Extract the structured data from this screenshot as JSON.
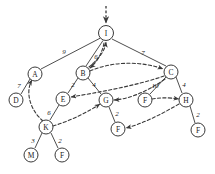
{
  "diagram": {
    "type": "directed-graph-with-back-edges",
    "title": "",
    "nodes": [
      {
        "id": "I",
        "label": "I",
        "x": 106,
        "y": 33,
        "r": 7.5
      },
      {
        "id": "A",
        "label": "A",
        "x": 35,
        "y": 74,
        "r": 7.0
      },
      {
        "id": "B",
        "label": "B",
        "x": 83,
        "y": 73,
        "r": 7.0
      },
      {
        "id": "C",
        "label": "C",
        "x": 171,
        "y": 72,
        "r": 7.0
      },
      {
        "id": "D",
        "label": "D",
        "x": 16,
        "y": 100,
        "r": 7.0
      },
      {
        "id": "E",
        "label": "E",
        "x": 63,
        "y": 99,
        "r": 7.0
      },
      {
        "id": "G",
        "label": "G",
        "x": 106,
        "y": 100,
        "r": 7.0
      },
      {
        "id": "F1",
        "label": "F",
        "x": 145,
        "y": 100,
        "r": 7.0
      },
      {
        "id": "H",
        "label": "H",
        "x": 186,
        "y": 100,
        "r": 7.0
      },
      {
        "id": "K",
        "label": "K",
        "x": 46,
        "y": 127,
        "r": 7.0
      },
      {
        "id": "F2",
        "label": "F",
        "x": 118,
        "y": 129,
        "r": 7.0
      },
      {
        "id": "F3",
        "label": "F",
        "x": 198,
        "y": 130,
        "r": 7.0
      },
      {
        "id": "M",
        "label": "M",
        "x": 31,
        "y": 155,
        "r": 7.0
      },
      {
        "id": "F4",
        "label": "F",
        "x": 62,
        "y": 155,
        "r": 7.0
      }
    ],
    "tree_edges": [
      {
        "from": "I",
        "to": "A",
        "weight": "9",
        "label_x": 64,
        "label_y": 52
      },
      {
        "from": "I",
        "to": "B",
        "weight": "6",
        "label_x": 96,
        "label_y": 57
      },
      {
        "from": "I",
        "to": "C",
        "weight": "7",
        "label_x": 143,
        "label_y": 53
      },
      {
        "from": "A",
        "to": "D",
        "weight": "7",
        "label_x": 19,
        "label_y": 86
      },
      {
        "from": "B",
        "to": "E",
        "weight": "2",
        "label_x": 73,
        "label_y": 85
      },
      {
        "from": "B",
        "to": "G",
        "weight": "4",
        "label_x": 94,
        "label_y": 85
      },
      {
        "from": "C",
        "to": "F1",
        "weight": "10",
        "label_x": 155,
        "label_y": 86
      },
      {
        "from": "C",
        "to": "H",
        "weight": "4",
        "label_x": 184,
        "label_y": 85
      },
      {
        "from": "E",
        "to": "K",
        "weight": "6",
        "label_x": 49,
        "label_y": 113
      },
      {
        "from": "G",
        "to": "F2",
        "weight": "2",
        "label_x": 117,
        "label_y": 114
      },
      {
        "from": "H",
        "to": "F3",
        "weight": "2",
        "label_x": 198,
        "label_y": 115
      },
      {
        "from": "K",
        "to": "M",
        "weight": "3",
        "label_x": 33,
        "label_y": 141
      },
      {
        "from": "K",
        "to": "F4",
        "weight": "2",
        "label_x": 60,
        "label_y": 141
      }
    ],
    "back_edges": [
      {
        "from": "B",
        "to": "I",
        "style": "dashed"
      },
      {
        "from": "B",
        "to": "C",
        "style": "dashed"
      },
      {
        "from": "C",
        "to": "E",
        "style": "dashed"
      },
      {
        "from": "C",
        "to": "G",
        "style": "dashed"
      },
      {
        "from": "K",
        "to": "A",
        "style": "dashed"
      },
      {
        "from": "K",
        "to": "G",
        "style": "dashed"
      },
      {
        "from": "F1",
        "to": "H",
        "style": "dashed"
      },
      {
        "from": "H",
        "to": "F2",
        "style": "dashed"
      }
    ],
    "entry_arrow": {
      "into": "I",
      "style": "dashed",
      "from_x": 106,
      "from_y": 6,
      "to_x": 106,
      "to_y": 24
    },
    "colors": {
      "stroke": "#3a3a3a",
      "text": "#1a1a1a",
      "background": "#ffffff"
    }
  }
}
